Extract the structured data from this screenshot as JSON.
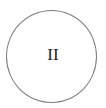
{
  "diagram": {
    "node": {
      "shape": "circle",
      "label": "II",
      "stroke_color": "#7a7a7a",
      "text_color": "#222222",
      "fill_color": "#ffffff"
    }
  }
}
